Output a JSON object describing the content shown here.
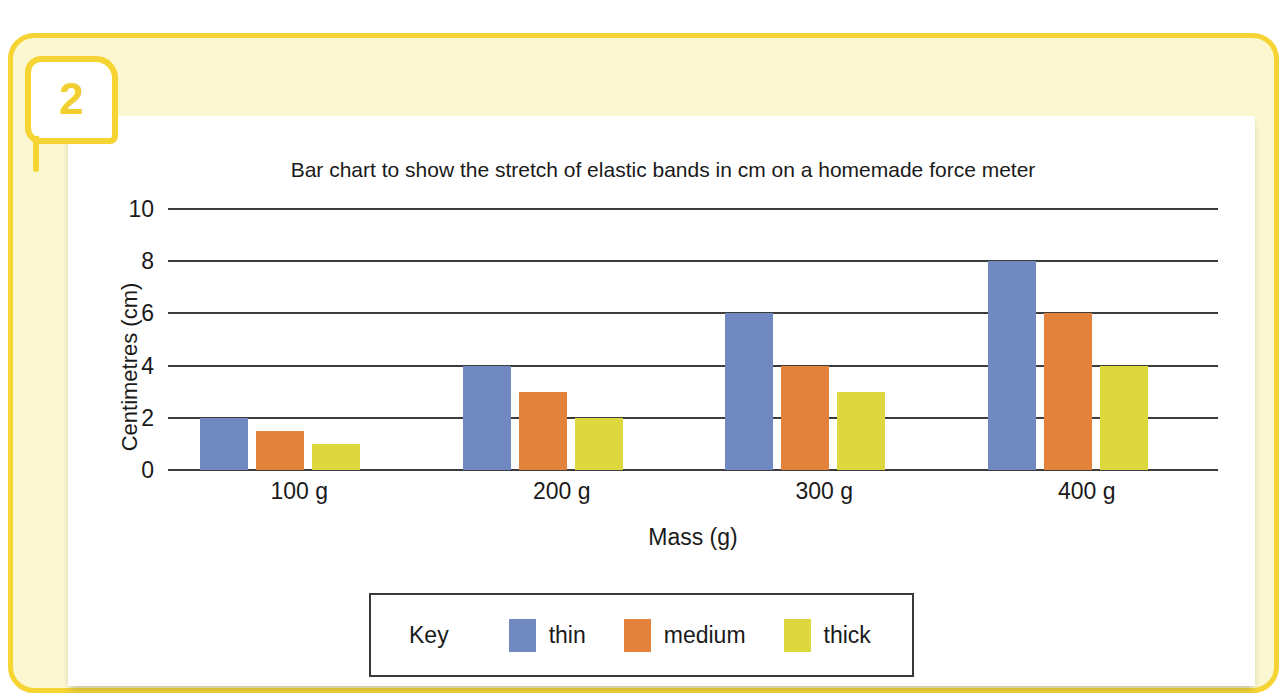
{
  "question": {
    "number": "2"
  },
  "chart_data": {
    "type": "bar",
    "title": "Bar chart to show the stretch of elastic bands in cm on a homemade force meter",
    "xlabel": "Mass (g)",
    "ylabel": "Centimetres (cm)",
    "categories": [
      "100 g",
      "200 g",
      "300 g",
      "400 g"
    ],
    "series": [
      {
        "name": "thin",
        "color": "#7089c0",
        "values": [
          2,
          4,
          6,
          8
        ]
      },
      {
        "name": "medium",
        "color": "#e3823a",
        "values": [
          1.5,
          3,
          4,
          6
        ]
      },
      {
        "name": "thick",
        "color": "#dcd83e",
        "values": [
          1,
          2,
          3,
          4
        ]
      }
    ],
    "ylim": [
      0,
      10
    ],
    "yticks": [
      "0",
      "2",
      "4",
      "6",
      "8",
      "10"
    ],
    "grid": true,
    "legend_position": "bottom"
  },
  "legend": {
    "title": "Key"
  }
}
